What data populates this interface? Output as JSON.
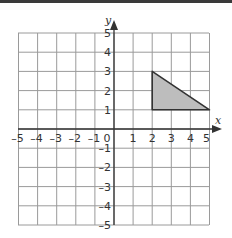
{
  "chart_data": {
    "type": "coordinate-grid",
    "title": "",
    "xlabel": "x",
    "ylabel": "y",
    "xlim": [
      -5,
      5
    ],
    "ylim": [
      -5,
      5
    ],
    "grid": true,
    "x_ticks": [
      "-5",
      "-4",
      "-3",
      "-2",
      "-1",
      "0",
      "1",
      "2",
      "3",
      "4",
      "5"
    ],
    "y_ticks": [
      "5",
      "4",
      "3",
      "2",
      "1",
      "-1",
      "-2",
      "-3",
      "-4",
      "-5"
    ],
    "shapes": [
      {
        "type": "triangle",
        "vertices": [
          [
            2,
            1
          ],
          [
            2,
            3
          ],
          [
            5,
            1
          ]
        ],
        "fill": "#bdbdbd",
        "stroke": "#333333"
      }
    ]
  },
  "labels": {
    "x_axis": "x",
    "y_axis": "y",
    "origin": "0",
    "xneg": [
      "–5",
      "–4",
      "–3",
      "–2",
      "–1"
    ],
    "xpos": [
      "1",
      "2",
      "3",
      "4",
      "5"
    ],
    "ypos": [
      "1",
      "2",
      "3",
      "4",
      "5"
    ],
    "yneg": [
      "–1",
      "–2",
      "–3",
      "–4",
      "–5"
    ]
  },
  "colors": {
    "grid": "#9a9a9a",
    "axis": "#333333",
    "shape_fill": "#bdbdbd",
    "shape_stroke": "#333333"
  }
}
